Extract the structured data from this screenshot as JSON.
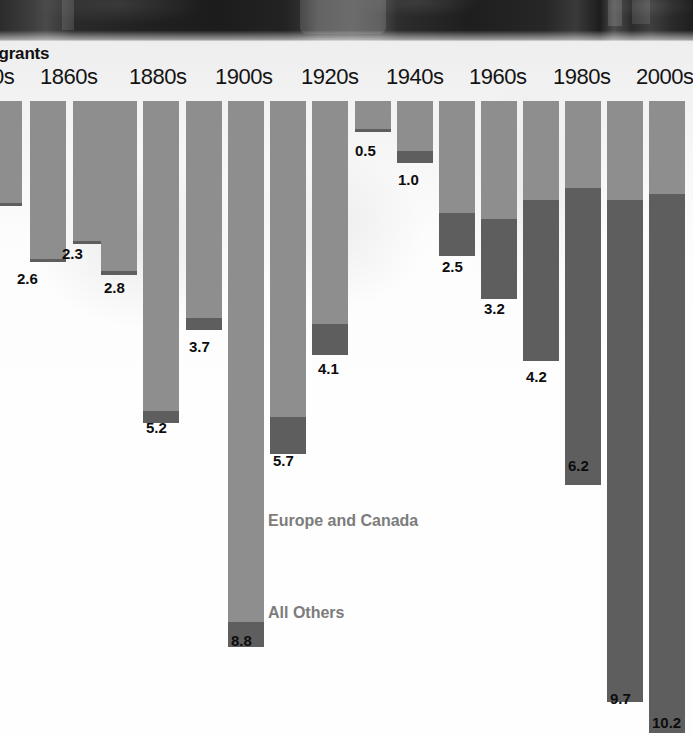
{
  "title": "igrants",
  "photo": {
    "caption_alt": "luggage-photo-strip"
  },
  "series_notes": {
    "europe": "Europe and Canada",
    "others": "All Others"
  },
  "colors": {
    "europe_and_canada": "#8e8e8e",
    "all_others": "#5e5e5e",
    "value_label": "#0d0d0d",
    "axis_label": "#141414",
    "series_note": "#7c7c7c",
    "background": "#ffffff"
  },
  "axis": {
    "decades": [
      {
        "label": "0s",
        "x": -8
      },
      {
        "label": "1860s",
        "x": 40
      },
      {
        "label": "1880s",
        "x": 129
      },
      {
        "label": "1900s",
        "x": 215
      },
      {
        "label": "1920s",
        "x": 301
      },
      {
        "label": "1940s",
        "x": 386
      },
      {
        "label": "1960s",
        "x": 469
      },
      {
        "label": "1980s",
        "x": 553
      },
      {
        "label": "2000s",
        "x": 636
      }
    ]
  },
  "chart_data": {
    "type": "bar",
    "title": "igrants",
    "xlabel": "",
    "ylabel": "Immigrants (millions)",
    "orientation": "downward-hanging-stacked",
    "stacked": true,
    "ylim": [
      0,
      10.2
    ],
    "grid": false,
    "legend": [
      "Europe and Canada",
      "All Others"
    ],
    "legend_position": "inline-annotation",
    "categories": [
      "1840s",
      "1850s",
      "1860s",
      "1870s",
      "1880s",
      "1890s",
      "1900s",
      "1910s",
      "1920s",
      "1930s",
      "1940s",
      "1950s",
      "1960s",
      "1970s",
      "1980s",
      "1990s",
      "2000s"
    ],
    "values": [
      1.7,
      2.6,
      2.3,
      2.8,
      5.2,
      3.7,
      8.8,
      5.7,
      4.1,
      0.5,
      1.0,
      2.5,
      3.2,
      4.2,
      6.2,
      9.7,
      10.2
    ],
    "labels_shown": [
      "",
      "2.6",
      "2.3",
      "2.8",
      "5.2",
      "3.7",
      "8.8",
      "5.7",
      "4.1",
      "0.5",
      "1.0",
      "2.5",
      "3.2",
      "4.2",
      "6.2",
      "9.7",
      "10.2"
    ],
    "series": [
      {
        "name": "Europe and Canada",
        "values": [
          1.65,
          2.55,
          2.26,
          2.74,
          5.0,
          3.5,
          8.4,
          5.1,
          3.6,
          0.45,
          0.8,
          1.8,
          1.9,
          1.6,
          1.4,
          1.6,
          1.5
        ]
      },
      {
        "name": "All Others",
        "values": [
          0.05,
          0.05,
          0.04,
          0.06,
          0.2,
          0.2,
          0.4,
          0.6,
          0.5,
          0.05,
          0.2,
          0.7,
          1.3,
          2.6,
          4.8,
          8.1,
          8.7
        ]
      }
    ]
  },
  "bars": [
    {
      "name": "1840s",
      "x": -12,
      "w": 34,
      "total": 1.7,
      "europe": 1.65,
      "others": 0.05,
      "label": "",
      "label_x": 0,
      "label_y": 0
    },
    {
      "name": "1850s",
      "x": 30,
      "w": 36,
      "total": 2.6,
      "europe": 2.55,
      "others": 0.05,
      "label": "2.6",
      "label_x": 17,
      "label_y": 270
    },
    {
      "name": "1860s",
      "x": 73,
      "w": 36,
      "total": 2.3,
      "europe": 2.26,
      "others": 0.04,
      "label": "2.3",
      "label_x": 62,
      "label_y": 245
    },
    {
      "name": "1870s",
      "x": 101,
      "w": 36,
      "total": 2.8,
      "europe": 2.74,
      "others": 0.06,
      "label": "2.8",
      "label_x": 104,
      "label_y": 279
    },
    {
      "name": "1880s",
      "x": 143,
      "w": 36,
      "total": 5.2,
      "europe": 5.0,
      "others": 0.2,
      "label": "5.2",
      "label_x": 146,
      "label_y": 419
    },
    {
      "name": "1890s",
      "x": 186,
      "w": 36,
      "total": 3.7,
      "europe": 3.5,
      "others": 0.2,
      "label": "3.7",
      "label_x": 189,
      "label_y": 338
    },
    {
      "name": "1900s",
      "x": 228,
      "w": 36,
      "total": 8.8,
      "europe": 8.4,
      "others": 0.4,
      "label": "8.8",
      "label_x": 231,
      "label_y": 632
    },
    {
      "name": "1910s",
      "x": 270,
      "w": 36,
      "total": 5.7,
      "europe": 5.1,
      "others": 0.6,
      "label": "5.7",
      "label_x": 273,
      "label_y": 452
    },
    {
      "name": "1920s",
      "x": 312,
      "w": 36,
      "total": 4.1,
      "europe": 3.6,
      "others": 0.5,
      "label": "4.1",
      "label_x": 318,
      "label_y": 360
    },
    {
      "name": "1930s",
      "x": 355,
      "w": 36,
      "total": 0.5,
      "europe": 0.45,
      "others": 0.05,
      "label": "0.5",
      "label_x": 355,
      "label_y": 142
    },
    {
      "name": "1940s",
      "x": 397,
      "w": 36,
      "total": 1.0,
      "europe": 0.8,
      "others": 0.2,
      "label": "1.0",
      "label_x": 398,
      "label_y": 171
    },
    {
      "name": "1950s",
      "x": 439,
      "w": 36,
      "total": 2.5,
      "europe": 1.8,
      "others": 0.7,
      "label": "2.5",
      "label_x": 442,
      "label_y": 258
    },
    {
      "name": "1960s",
      "x": 481,
      "w": 36,
      "total": 3.2,
      "europe": 1.9,
      "others": 1.3,
      "label": "3.2",
      "label_x": 484,
      "label_y": 300
    },
    {
      "name": "1970s",
      "x": 523,
      "w": 36,
      "total": 4.2,
      "europe": 1.6,
      "others": 2.6,
      "label": "4.2",
      "label_x": 526,
      "label_y": 368
    },
    {
      "name": "1980s",
      "x": 565,
      "w": 36,
      "total": 6.2,
      "europe": 1.4,
      "others": 4.8,
      "label": "6.2",
      "label_x": 568,
      "label_y": 457
    },
    {
      "name": "1990s",
      "x": 607,
      "w": 36,
      "total": 9.7,
      "europe": 1.6,
      "others": 8.1,
      "label": "9.7",
      "label_x": 610,
      "label_y": 690
    },
    {
      "name": "2000s",
      "x": 649,
      "w": 36,
      "total": 10.2,
      "europe": 1.5,
      "others": 8.7,
      "label": "10.2",
      "label_x": 652,
      "label_y": 714
    }
  ]
}
